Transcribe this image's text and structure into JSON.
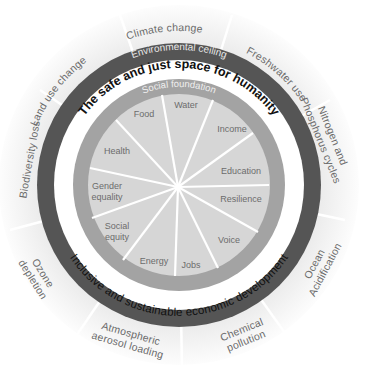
{
  "diagram": {
    "rings": {
      "ceiling": "Environmental ceiling",
      "space": "The safe and just space for humanity",
      "foundation": "Social foundation",
      "development": "Inclusive and sustainable economic development"
    },
    "outer_labels": {
      "climate": "Climate change",
      "freshwater": "Freshwater use",
      "nitrogen_1": "Nitrogen and",
      "nitrogen_2": "Phosphorus cycles",
      "ocean_1": "Ocean",
      "ocean_2": "Acidification",
      "chemical_1": "Chemical",
      "chemical_2": "pollution",
      "aerosol_1": "Atmospheric",
      "aerosol_2": "aerosol loading",
      "ozone_1": "Ozone",
      "ozone_2": "depletion",
      "biodiversity": "Biodiversity loss",
      "landuse": "Land use change"
    },
    "inner_labels": {
      "water": "Water",
      "income": "Income",
      "education": "Education",
      "resilience": "Resilience",
      "voice": "Voice",
      "jobs": "Jobs",
      "energy": "Energy",
      "social_equity_1": "Social",
      "social_equity_2": "equity",
      "gender_1": "Gender",
      "gender_2": "equality",
      "health": "Health",
      "food": "Food"
    },
    "colors": {
      "outer_band": "#ebebeb",
      "ceiling_ring": "#555555",
      "space_ring": "#ffffff",
      "foundation_ring": "#a3a3a3",
      "core": "#d6d6d6",
      "separator": "#ffffff"
    }
  }
}
